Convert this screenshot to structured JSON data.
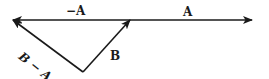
{
  "diagram": {
    "type": "vector-subtraction",
    "colors": {
      "stroke": "#1a1a1a",
      "background": "#ffffff"
    },
    "vectors": [
      {
        "id": "A",
        "label": "A",
        "from": [
          130,
          20
        ],
        "to": [
          252,
          20
        ]
      },
      {
        "id": "negA",
        "label": "−A",
        "from": [
          130,
          20
        ],
        "to": [
          13,
          20
        ]
      },
      {
        "id": "B",
        "label": "B",
        "from": [
          83,
          72
        ],
        "to": [
          130,
          20
        ]
      },
      {
        "id": "BminusA",
        "label": "B − A",
        "from": [
          83,
          72
        ],
        "to": [
          13,
          20
        ]
      }
    ],
    "labels": {
      "neg_a": "−A",
      "a": "A",
      "b": "B",
      "b_minus_a": "B − A"
    }
  }
}
